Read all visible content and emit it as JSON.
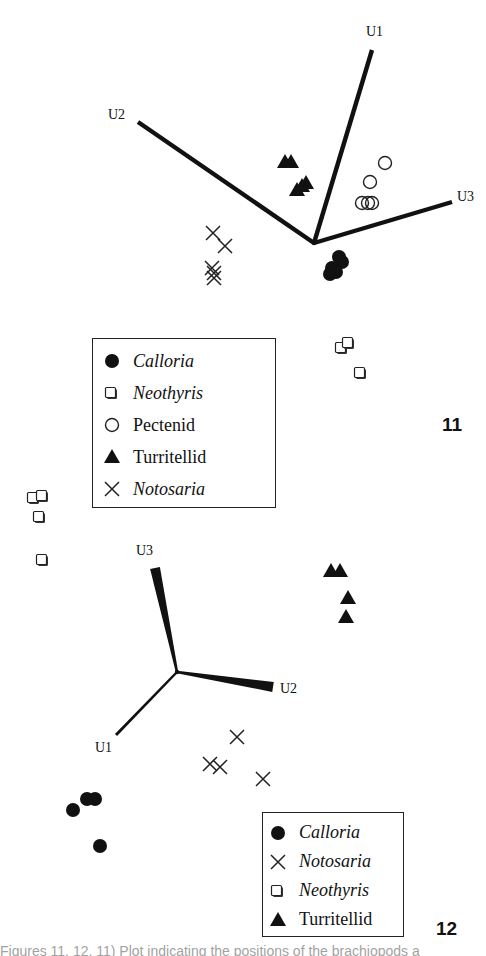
{
  "figure11": {
    "number": "11",
    "axes": [
      {
        "label": "U1",
        "end": [
          372,
          50
        ],
        "label_pos": [
          366,
          36
        ]
      },
      {
        "label": "U2",
        "end": [
          138,
          122
        ],
        "label_pos": [
          108,
          119
        ]
      },
      {
        "label": "U3",
        "end": [
          452,
          202
        ],
        "label_pos": [
          457,
          201
        ]
      }
    ],
    "origin": [
      314,
      243
    ],
    "legend": [
      {
        "symbol": "filled-circle",
        "label": "Calloria",
        "italic": true
      },
      {
        "symbol": "open-square",
        "label": "Neothyris",
        "italic": true
      },
      {
        "symbol": "open-circle",
        "label": "Pectenid",
        "italic": false
      },
      {
        "symbol": "filled-triangle",
        "label": "Turritellid",
        "italic": false
      },
      {
        "symbol": "cross",
        "label": "Notosaria",
        "italic": true
      }
    ]
  },
  "figure12": {
    "number": "12",
    "axes": [
      {
        "label": "U3",
        "end": [
          155,
          568
        ],
        "label_pos": [
          136,
          555
        ]
      },
      {
        "label": "U2",
        "end": [
          273,
          687
        ],
        "label_pos": [
          280,
          693
        ]
      },
      {
        "label": "U1",
        "end": [
          116,
          735
        ],
        "label_pos": [
          95,
          752
        ]
      }
    ],
    "origin": [
      177,
      672
    ],
    "legend": [
      {
        "symbol": "filled-circle",
        "label": "Calloria",
        "italic": true
      },
      {
        "symbol": "cross",
        "label": "Notosaria",
        "italic": true
      },
      {
        "symbol": "open-square",
        "label": "Neothyris",
        "italic": true
      },
      {
        "symbol": "filled-triangle",
        "label": "Turritellid",
        "italic": false
      }
    ]
  },
  "caption": "Figures 11, 12. 11) Plot indicating the positions of the brachiopods a",
  "chart_data": [
    {
      "type": "scatter",
      "title": "11",
      "xlabel": "",
      "ylabel": "",
      "axis_vectors": [
        "U1",
        "U2",
        "U3"
      ],
      "grid": false,
      "legend_position": "lower-left",
      "series": [
        {
          "name": "Calloria",
          "marker": "filled-circle",
          "points": [
            [
              332,
              268
            ],
            [
              339,
              257
            ],
            [
              342,
              262
            ],
            [
              336,
              272
            ],
            [
              330,
              274
            ]
          ]
        },
        {
          "name": "Neothyris",
          "marker": "open-square",
          "points": [
            [
              342,
              348
            ],
            [
              349,
              343
            ],
            [
              361,
              373
            ]
          ]
        },
        {
          "name": "Pectenid",
          "marker": "open-circle",
          "points": [
            [
              385,
              163
            ],
            [
              370,
              182
            ],
            [
              362,
              203
            ],
            [
              368,
              203
            ],
            [
              372,
              203
            ]
          ]
        },
        {
          "name": "Turritellid",
          "marker": "filled-triangle",
          "points": [
            [
              285,
              162
            ],
            [
              291,
              162
            ],
            [
              297,
              190
            ],
            [
              302,
              186
            ],
            [
              306,
              183
            ]
          ]
        },
        {
          "name": "Notosaria",
          "marker": "cross",
          "points": [
            [
              213,
              233
            ],
            [
              225,
              246
            ],
            [
              212,
              268
            ],
            [
              214,
              273
            ],
            [
              214,
              278
            ]
          ]
        }
      ]
    },
    {
      "type": "scatter",
      "title": "12",
      "xlabel": "",
      "ylabel": "",
      "axis_vectors": [
        "U1",
        "U2",
        "U3"
      ],
      "grid": false,
      "legend_position": "lower-right",
      "series": [
        {
          "name": "Calloria",
          "marker": "filled-circle",
          "points": [
            [
              73,
              810
            ],
            [
              87,
              799
            ],
            [
              95,
              799
            ],
            [
              100,
              846
            ]
          ]
        },
        {
          "name": "Notosaria",
          "marker": "cross",
          "points": [
            [
              237,
              737
            ],
            [
              210,
              764
            ],
            [
              220,
              767
            ],
            [
              263,
              779
            ]
          ]
        },
        {
          "name": "Neothyris",
          "marker": "open-square",
          "points": [
            [
              34,
              498
            ],
            [
              43,
              496
            ],
            [
              40,
              517
            ],
            [
              43,
              560
            ]
          ]
        },
        {
          "name": "Turritellid",
          "marker": "filled-triangle",
          "points": [
            [
              331,
              571
            ],
            [
              340,
              571
            ],
            [
              348,
              598
            ],
            [
              346,
              617
            ]
          ]
        }
      ]
    }
  ]
}
